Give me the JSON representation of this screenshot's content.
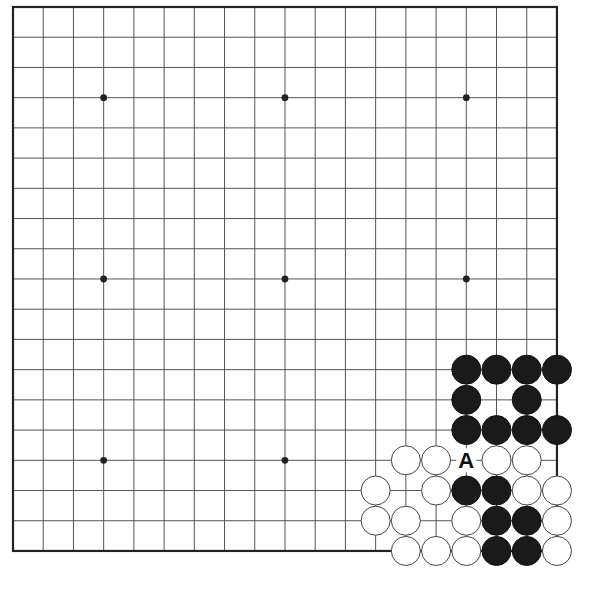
{
  "board": {
    "size": 19,
    "origin_x": 13,
    "origin_y": 7,
    "spacing": 30.22,
    "visible_edges": [
      "top",
      "left",
      "right",
      "bottom"
    ],
    "colors": {
      "line": "#555555",
      "edge": "#222222",
      "black": "#1a1a1a",
      "white": "#ffffff"
    },
    "star_points": [
      [
        3,
        3
      ],
      [
        9,
        3
      ],
      [
        15,
        3
      ],
      [
        3,
        9
      ],
      [
        9,
        9
      ],
      [
        15,
        9
      ],
      [
        3,
        15
      ],
      [
        9,
        15
      ]
    ],
    "stones": {
      "black": [
        [
          15,
          12
        ],
        [
          16,
          12
        ],
        [
          17,
          12
        ],
        [
          18,
          12
        ],
        [
          15,
          13
        ],
        [
          17,
          13
        ],
        [
          15,
          14
        ],
        [
          16,
          14
        ],
        [
          17,
          14
        ],
        [
          18,
          14
        ],
        [
          15,
          16
        ],
        [
          16,
          16
        ],
        [
          16,
          17
        ],
        [
          17,
          17
        ],
        [
          16,
          18
        ],
        [
          17,
          18
        ]
      ],
      "white": [
        [
          13,
          15
        ],
        [
          14,
          15
        ],
        [
          16,
          15
        ],
        [
          17,
          15
        ],
        [
          12,
          16
        ],
        [
          14,
          16
        ],
        [
          17,
          16
        ],
        [
          18,
          16
        ],
        [
          12,
          17
        ],
        [
          13,
          17
        ],
        [
          15,
          17
        ],
        [
          18,
          17
        ],
        [
          13,
          18
        ],
        [
          14,
          18
        ],
        [
          15,
          18
        ],
        [
          18,
          18
        ]
      ]
    },
    "labels": [
      {
        "text": "A",
        "col": 15,
        "row": 15
      }
    ]
  }
}
